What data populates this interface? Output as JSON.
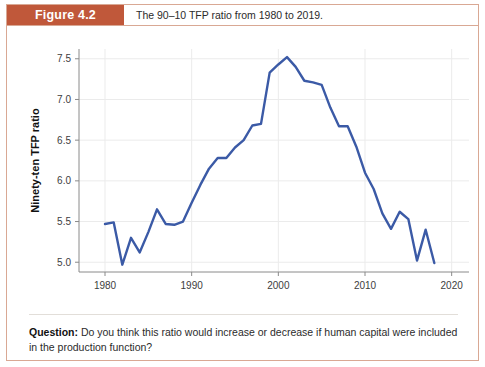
{
  "figure": {
    "tag": "Figure 4.2",
    "caption": "The 90–10 TFP ratio from 1980 to 2019.",
    "tag_bg_color": "#c0583a",
    "border_color": "#d9a894"
  },
  "question": {
    "label": "Question:",
    "text": " Do you think this ratio would increase or decrease if human capital were included in the production function?"
  },
  "chart_data": {
    "type": "line",
    "title": "",
    "xlabel": "Year",
    "ylabel": "Ninety-ten TFP ratio",
    "xlim": [
      1977,
      2022
    ],
    "ylim": [
      4.88,
      7.62
    ],
    "xticks": [
      1980,
      1990,
      2000,
      2010,
      2020
    ],
    "xtick_labels": [
      "1980",
      "1990",
      "2000",
      "2010",
      "2020"
    ],
    "yticks": [
      5.0,
      5.5,
      6.0,
      6.5,
      7.0,
      7.5
    ],
    "ytick_labels": [
      "5.0",
      "5.5",
      "6.0",
      "6.5",
      "7.0",
      "7.5"
    ],
    "grid": true,
    "grid_color": "#ebebeb",
    "legend": "none",
    "line_color": "#3b5aa6",
    "line_width": 2.4,
    "series": [
      {
        "name": "90-10 TFP ratio",
        "x": [
          1980,
          1981,
          1982,
          1983,
          1984,
          1985,
          1986,
          1987,
          1988,
          1989,
          1990,
          1991,
          1992,
          1993,
          1994,
          1995,
          1996,
          1997,
          1998,
          1999,
          2000,
          2001,
          2002,
          2003,
          2004,
          2005,
          2006,
          2007,
          2008,
          2009,
          2010,
          2011,
          2012,
          2013,
          2014,
          2015,
          2016,
          2017,
          2018
        ],
        "values": [
          5.47,
          5.49,
          4.97,
          5.3,
          5.12,
          5.37,
          5.65,
          5.47,
          5.46,
          5.5,
          5.73,
          5.95,
          6.15,
          6.28,
          6.28,
          6.41,
          6.5,
          6.68,
          6.7,
          7.33,
          7.43,
          7.52,
          7.4,
          7.23,
          7.21,
          7.18,
          6.9,
          6.67,
          6.67,
          6.42,
          6.1,
          5.9,
          5.6,
          5.41,
          5.62,
          5.53,
          5.02,
          5.4,
          4.99
        ]
      }
    ]
  }
}
